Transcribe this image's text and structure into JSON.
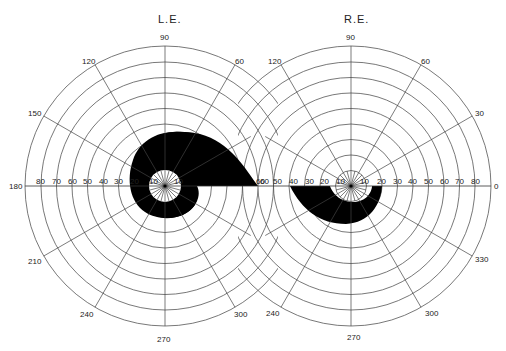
{
  "chart_data": {
    "type": "polar-visual-field",
    "title": "",
    "fields": [
      {
        "eye": "L.E.",
        "center": [
          165,
          186
        ],
        "ring_step_px": 15.5,
        "rings_deg": [
          10,
          20,
          30,
          40,
          50,
          60,
          70,
          80,
          90
        ],
        "meridian_labels": [
          "90",
          "120",
          "150",
          "180",
          "210",
          "240",
          "270",
          "300",
          "60"
        ],
        "horizontal_scale_labels": [
          "80",
          "70",
          "60",
          "50",
          "40",
          "30",
          "20",
          "10",
          "10",
          "60"
        ],
        "defect": {
          "description": "Dense scotoma wrapping around fixation from ~10° to ~40° superiorly, extending temporally to 60° along horizontal meridian; spares central 10°",
          "shape": "spiral/annular"
        }
      },
      {
        "eye": "R.E.",
        "center": [
          351,
          186
        ],
        "ring_step_px": 15.5,
        "rings_deg": [
          10,
          20,
          30,
          40,
          50,
          60,
          70,
          80,
          90
        ],
        "meridian_labels": [
          "90",
          "120",
          "60",
          "30",
          "0",
          "330",
          "300",
          "270",
          "240"
        ],
        "horizontal_scale_labels": [
          "60",
          "50",
          "40",
          "30",
          "20",
          "10",
          "10",
          "20",
          "30",
          "40",
          "50",
          "60",
          "70",
          "80"
        ],
        "defect": {
          "description": "Inferior arcuate scotoma from ~10° to ~40° below the horizontal meridian, spanning nasal 40° to temporal 20°",
          "shape": "inferior arcuate"
        }
      }
    ],
    "legend": []
  },
  "labels": {
    "le_title": "L.E.",
    "re_title": "R.E.",
    "le_90": "90",
    "le_120": "120",
    "le_60": "60",
    "le_150": "150",
    "le_180": "180",
    "le_210": "210",
    "le_240": "240",
    "le_270": "270",
    "le_300": "300",
    "re_90": "90",
    "re_120": "120",
    "re_60": "60",
    "re_30": "30",
    "re_0": "0",
    "re_330": "330",
    "re_300": "300",
    "re_270": "270",
    "re_240": "240",
    "le_h": [
      "80",
      "70",
      "60",
      "50",
      "40",
      "30",
      "20",
      "10",
      "10",
      "60"
    ],
    "re_h": [
      "60",
      "50",
      "40",
      "30",
      "20",
      "10",
      "10",
      "20",
      "30",
      "40",
      "50",
      "60",
      "70",
      "80"
    ]
  }
}
